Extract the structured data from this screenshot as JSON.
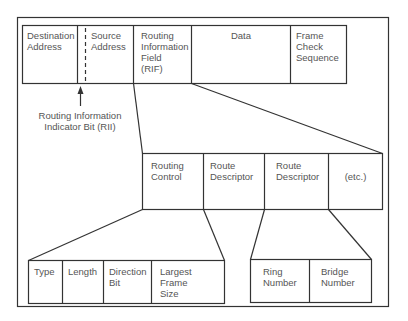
{
  "diagram": {
    "top_row": [
      {
        "id": "destination-address",
        "label": "Destination\nAddress"
      },
      {
        "id": "source-address",
        "label": "Source\nAddress"
      },
      {
        "id": "rif",
        "label": "Routing\nInformation\nField\n(RIF)"
      },
      {
        "id": "data",
        "label": "Data"
      },
      {
        "id": "fcs",
        "label": "Frame\nCheck\nSequence"
      }
    ],
    "rii_annotation": "Routing Information\nIndicator Bit (RII)",
    "rif_row": [
      {
        "id": "routing-control",
        "label": "Routing\nControl"
      },
      {
        "id": "route-descriptor-1",
        "label": "Route\nDescriptor"
      },
      {
        "id": "route-descriptor-2",
        "label": "Route\nDescriptor"
      },
      {
        "id": "etc",
        "label": "(etc.)"
      }
    ],
    "routing_control_row": [
      {
        "id": "type",
        "label": "Type"
      },
      {
        "id": "length",
        "label": "Length"
      },
      {
        "id": "direction-bit",
        "label": "Direction\nBit"
      },
      {
        "id": "largest-frame-size",
        "label": "Largest\nFrame\nSize"
      }
    ],
    "route_descriptor_row": [
      {
        "id": "ring-number",
        "label": "Ring\nNumber"
      },
      {
        "id": "bridge-number",
        "label": "Bridge\nNumber"
      }
    ],
    "colors": {
      "line": "#333333",
      "text": "#555555",
      "background": "#ffffff"
    }
  }
}
